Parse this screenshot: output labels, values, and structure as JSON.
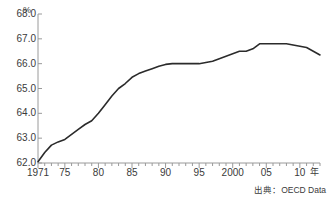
{
  "chart_data": {
    "type": "line",
    "title": "",
    "xlabel": "年",
    "ylabel": "%",
    "unit_label": "%",
    "x_unit_label": "年",
    "source": "出典：OECD Data",
    "grid": false,
    "legend": "none",
    "line_color": "#2b2b2b",
    "axis_color": "#9a9a9a",
    "text_color": "#3a3a3a",
    "xlim": [
      1971,
      2013
    ],
    "ylim": [
      62.0,
      68.0
    ],
    "y_ticks": [
      "68.0",
      "67.0",
      "66.0",
      "65.0",
      "64.0",
      "63.0",
      "62.0"
    ],
    "y_tick_values": [
      68.0,
      67.0,
      66.0,
      65.0,
      64.0,
      63.0,
      62.0
    ],
    "x_ticks": [
      "1971",
      "75",
      "80",
      "85",
      "90",
      "95",
      "2000",
      "05",
      "10"
    ],
    "x_tick_values": [
      1971,
      1975,
      1980,
      1985,
      1990,
      1995,
      2000,
      2005,
      2010
    ],
    "x_minor_tick_step": 1,
    "x": [
      1971,
      1972,
      1973,
      1974,
      1975,
      1976,
      1977,
      1978,
      1979,
      1980,
      1981,
      1982,
      1983,
      1984,
      1985,
      1986,
      1987,
      1988,
      1989,
      1990,
      1991,
      1992,
      1993,
      1994,
      1995,
      1996,
      1997,
      1998,
      1999,
      2000,
      2001,
      2002,
      2003,
      2004,
      2005,
      2006,
      2007,
      2008,
      2009,
      2010,
      2011,
      2012,
      2013
    ],
    "values": [
      62.05,
      62.42,
      62.72,
      62.85,
      62.95,
      63.15,
      63.35,
      63.55,
      63.7,
      64.0,
      64.35,
      64.7,
      65.0,
      65.2,
      65.45,
      65.6,
      65.7,
      65.8,
      65.9,
      65.97,
      66.0,
      66.0,
      66.0,
      66.0,
      66.0,
      66.05,
      66.1,
      66.2,
      66.3,
      66.4,
      66.5,
      66.5,
      66.6,
      66.8,
      66.8,
      66.8,
      66.8,
      66.8,
      66.75,
      66.7,
      66.65,
      66.5,
      66.35
    ],
    "series_name": ""
  }
}
